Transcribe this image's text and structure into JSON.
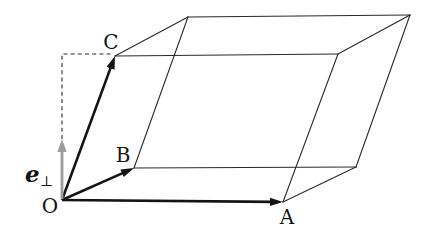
{
  "figure": {
    "background_color": "#ffffff",
    "edge_color": "#2b2b2b",
    "vector_color": "#141414",
    "perp_arrow_color": "#9c9c9c",
    "labels": [
      {
        "id": "label-O",
        "text": "O",
        "x": 50,
        "y": 213
      },
      {
        "id": "label-A",
        "text": "A",
        "x": 287,
        "y": 224
      },
      {
        "id": "label-B",
        "text": "B",
        "x": 123,
        "y": 162
      },
      {
        "id": "label-C",
        "text": "C",
        "x": 111,
        "y": 49
      },
      {
        "id": "label-e-perp",
        "text": "e",
        "sub": "⊥",
        "x": 25,
        "y": 182
      }
    ],
    "vertices": {
      "O": [
        62,
        200
      ],
      "A": [
        283,
        202
      ],
      "B": [
        134,
        168
      ],
      "C": [
        115,
        56
      ],
      "AB": [
        356,
        167
      ],
      "AC": [
        338,
        54
      ],
      "BC": [
        188,
        17
      ],
      "ABC": [
        410,
        15
      ]
    },
    "edges": [
      [
        "B",
        "AB"
      ],
      [
        "AB",
        "A"
      ],
      [
        "A",
        "AC"
      ],
      [
        "AC",
        "C"
      ],
      [
        "AC",
        "ABC"
      ],
      [
        "ABC",
        "BC"
      ],
      [
        "BC",
        "C"
      ],
      [
        "ABC",
        "AB"
      ],
      [
        "B",
        "BC"
      ]
    ],
    "vectors": [
      {
        "name": "vector-OA",
        "from": "O",
        "to": "A"
      },
      {
        "name": "vector-OB",
        "from": "O",
        "to": "B"
      },
      {
        "name": "vector-OC",
        "from": "O",
        "to": "C"
      }
    ],
    "perpendicular_axis": {
      "name": "vector-e-perp",
      "from": [
        62,
        199
      ],
      "to": [
        62,
        139
      ]
    },
    "dashed_projection": {
      "points": [
        [
          62,
          139
        ],
        [
          62,
          54
        ],
        [
          113,
          54
        ]
      ]
    }
  }
}
